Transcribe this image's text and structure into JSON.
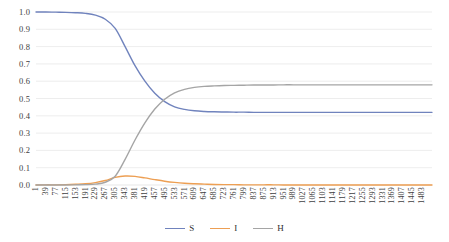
{
  "chart_data": {
    "type": "line",
    "title": "",
    "xlabel": "",
    "ylabel": "",
    "ylim": [
      0.0,
      1.0
    ],
    "grid": true,
    "legend_position": "bottom",
    "y_ticks": [
      "0.0",
      "0.1",
      "0.2",
      "0.3",
      "0.4",
      "0.5",
      "0.6",
      "0.7",
      "0.8",
      "0.9",
      "1.0"
    ],
    "y_tick_values": [
      0.0,
      0.1,
      0.2,
      0.3,
      0.4,
      0.5,
      0.6,
      0.7,
      0.8,
      0.9,
      1.0
    ],
    "x_tick_labels": [
      "1",
      "39",
      "77",
      "115",
      "153",
      "191",
      "229",
      "267",
      "305",
      "343",
      "381",
      "419",
      "457",
      "495",
      "533",
      "571",
      "609",
      "647",
      "685",
      "723",
      "761",
      "799",
      "837",
      "875",
      "913",
      "951",
      "989",
      "1027",
      "1065",
      "1103",
      "1141",
      "1179",
      "1217",
      "1255",
      "1293",
      "1331",
      "1369",
      "1407",
      "1445",
      "1483"
    ],
    "x_tick_values": [
      1,
      39,
      77,
      115,
      153,
      191,
      229,
      267,
      305,
      343,
      381,
      419,
      457,
      495,
      533,
      571,
      609,
      647,
      685,
      723,
      761,
      799,
      837,
      875,
      913,
      951,
      989,
      1027,
      1065,
      1103,
      1141,
      1179,
      1217,
      1255,
      1293,
      1331,
      1369,
      1407,
      1445,
      1483
    ],
    "x_start": 1,
    "x_end": 1521,
    "series": [
      {
        "name": "S",
        "color": "#7083bd",
        "x": [
          1,
          39,
          77,
          115,
          153,
          191,
          229,
          267,
          305,
          343,
          381,
          419,
          457,
          495,
          533,
          571,
          609,
          647,
          685,
          723,
          761,
          799,
          837,
          875,
          913,
          951,
          989,
          1027,
          1065,
          1103,
          1141,
          1179,
          1217,
          1255,
          1293,
          1331,
          1369,
          1407,
          1445,
          1483,
          1521
        ],
        "values": [
          1.0,
          1.0,
          0.999,
          0.998,
          0.996,
          0.992,
          0.982,
          0.958,
          0.905,
          0.8,
          0.69,
          0.6,
          0.53,
          0.482,
          0.452,
          0.437,
          0.429,
          0.425,
          0.423,
          0.422,
          0.421,
          0.421,
          0.42,
          0.42,
          0.42,
          0.42,
          0.42,
          0.42,
          0.42,
          0.42,
          0.42,
          0.42,
          0.42,
          0.42,
          0.42,
          0.42,
          0.42,
          0.42,
          0.42,
          0.42,
          0.42
        ]
      },
      {
        "name": "I",
        "color": "#ed9f53",
        "x": [
          1,
          39,
          77,
          115,
          153,
          191,
          229,
          267,
          305,
          343,
          381,
          419,
          457,
          495,
          533,
          571,
          609,
          647,
          685,
          723,
          761,
          799,
          837,
          875,
          913,
          951,
          989,
          1027,
          1065,
          1103,
          1141,
          1179,
          1217,
          1255,
          1293,
          1331,
          1369,
          1407,
          1445,
          1483,
          1521
        ],
        "values": [
          0.0,
          0.001,
          0.001,
          0.002,
          0.004,
          0.007,
          0.014,
          0.026,
          0.044,
          0.052,
          0.05,
          0.041,
          0.031,
          0.022,
          0.015,
          0.01,
          0.007,
          0.005,
          0.003,
          0.002,
          0.002,
          0.001,
          0.001,
          0.001,
          0.001,
          0.0,
          0.0,
          0.0,
          0.0,
          0.0,
          0.0,
          0.0,
          0.0,
          0.0,
          0.0,
          0.0,
          0.0,
          0.0,
          0.0,
          0.0,
          0.0
        ]
      },
      {
        "name": "H",
        "color": "#a5a5a5",
        "x": [
          1,
          39,
          77,
          115,
          153,
          191,
          229,
          267,
          305,
          343,
          381,
          419,
          457,
          495,
          533,
          571,
          609,
          647,
          685,
          723,
          761,
          799,
          837,
          875,
          913,
          951,
          989,
          1027,
          1065,
          1103,
          1141,
          1179,
          1217,
          1255,
          1293,
          1331,
          1369,
          1407,
          1445,
          1483,
          1521
        ],
        "values": [
          0.0,
          0.0,
          0.0,
          0.0,
          0.001,
          0.002,
          0.005,
          0.016,
          0.051,
          0.148,
          0.26,
          0.359,
          0.439,
          0.496,
          0.533,
          0.553,
          0.564,
          0.57,
          0.573,
          0.575,
          0.576,
          0.577,
          0.578,
          0.578,
          0.578,
          0.579,
          0.579,
          0.579,
          0.579,
          0.579,
          0.579,
          0.579,
          0.579,
          0.579,
          0.579,
          0.579,
          0.579,
          0.579,
          0.579,
          0.579,
          0.579
        ]
      }
    ]
  },
  "legend": {
    "items": [
      {
        "label": "S",
        "color": "#7083bd"
      },
      {
        "label": "I",
        "color": "#ed9f53"
      },
      {
        "label": "H",
        "color": "#a5a5a5"
      }
    ]
  },
  "colors": {
    "grid": "#e8e8e8",
    "axis_text": "#404040",
    "background": "#ffffff"
  }
}
